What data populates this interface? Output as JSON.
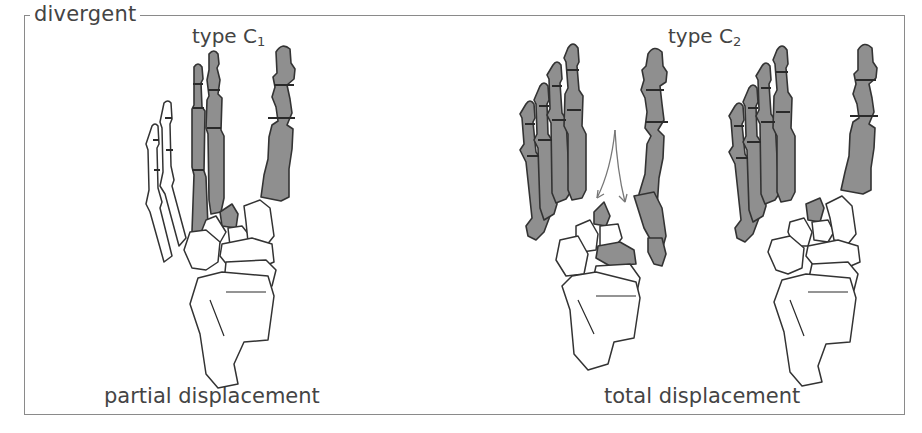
{
  "figure": {
    "frame_title": "divergent",
    "panels": [
      {
        "id": "c1",
        "label_prefix": "type C",
        "label_subscript": "1",
        "caption": "partial displacement"
      },
      {
        "id": "c2",
        "label_prefix": "type C",
        "label_subscript": "2",
        "caption": "total displacement"
      }
    ],
    "colors": {
      "displaced_bone_fill": "#8f8f8f",
      "bone_outline": "#333333",
      "frame_border": "#8a8a8a",
      "text": "#444444"
    }
  }
}
